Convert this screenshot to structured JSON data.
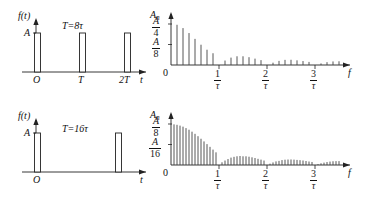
{
  "figure": {
    "stroke_color": "#222222",
    "line_color": "#444444",
    "background": "#ffffff"
  },
  "panels": [
    {
      "id": "time-top",
      "kind": "time-domain",
      "y_axis_label": "f(t)",
      "x_axis_label": "t",
      "amplitude_label": "A",
      "origin_label": "O",
      "period_note": "T=8τ",
      "x_tick_labels": [
        "O",
        "T",
        "2T"
      ],
      "pulse_count": 3
    },
    {
      "id": "spectrum-top",
      "kind": "spectrum",
      "y_axis_label": "A",
      "y_axis_label_sub": "n",
      "x_axis_label": "f",
      "origin_label": "0",
      "y_tick_labels": [
        {
          "num": "A",
          "den": "4"
        },
        {
          "num": "A",
          "den": "8"
        }
      ],
      "x_tick_labels": [
        {
          "num": "1",
          "den": "τ"
        },
        {
          "num": "2",
          "den": "τ"
        },
        {
          "num": "3",
          "den": "τ"
        }
      ]
    },
    {
      "id": "time-bottom",
      "kind": "time-domain",
      "y_axis_label": "f(t)",
      "x_axis_label": "t",
      "amplitude_label": "A",
      "origin_label": "O",
      "period_note": "T=16τ",
      "x_tick_labels": [
        "O"
      ],
      "pulse_count": 2
    },
    {
      "id": "spectrum-bottom",
      "kind": "spectrum",
      "y_axis_label": "A",
      "y_axis_label_sub": "n",
      "x_axis_label": "f",
      "origin_label": "0",
      "y_tick_labels": [
        {
          "num": "A",
          "den": "8"
        },
        {
          "num": "A",
          "den": "16"
        }
      ],
      "x_tick_labels": [
        {
          "num": "1",
          "den": "τ"
        },
        {
          "num": "2",
          "den": "τ"
        },
        {
          "num": "3",
          "den": "τ"
        }
      ]
    }
  ],
  "chart_data": [
    {
      "type": "bar",
      "id": "time-top",
      "title": "T=8τ",
      "xlabel": "t",
      "ylabel": "f(t)",
      "categories": [
        "O",
        "T",
        "2T"
      ],
      "values": [
        1,
        1,
        1
      ],
      "ylim": [
        0,
        1.15
      ],
      "notes": "Rectangular pulse train, pulse width τ, period T = 8τ, amplitude A",
      "grid": false,
      "legend": "none"
    },
    {
      "type": "bar",
      "id": "spectrum-top",
      "title": "Line spectrum for T=8τ",
      "xlabel": "f",
      "ylabel": "A_n",
      "ylim": [
        0,
        0.3125
      ],
      "yticks": [
        0,
        0.125,
        0.25
      ],
      "ytick_labels": [
        "0",
        "A/8",
        "A/4"
      ],
      "xticks": [
        0,
        1,
        2,
        3
      ],
      "xtick_labels": [
        "0",
        "1/τ",
        "2/τ",
        "3/τ"
      ],
      "harmonic_spacing_per_tau": 0.125,
      "x": [
        0.125,
        0.25,
        0.375,
        0.5,
        0.625,
        0.75,
        0.875,
        1.0,
        1.125,
        1.25,
        1.375,
        1.5,
        1.625,
        1.75,
        1.875,
        2.0,
        2.125,
        2.25,
        2.375,
        2.5,
        2.625,
        2.75,
        2.875,
        3.0,
        3.125,
        3.25,
        3.375,
        3.5
      ],
      "values": [
        0.2452,
        0.2251,
        0.1948,
        0.1592,
        0.1236,
        0.0932,
        0.0717,
        0.0,
        0.0272,
        0.045,
        0.0531,
        0.0531,
        0.0476,
        0.0388,
        0.0298,
        0.0,
        0.0141,
        0.025,
        0.0313,
        0.0318,
        0.0284,
        0.024,
        0.0188,
        0.0,
        0.0096,
        0.0173,
        0.0217,
        0.0227
      ],
      "envelope": "A*(tau/T)*|sinc(f*tau)| with tau/T = 1/8",
      "grid": false,
      "legend": "none"
    },
    {
      "type": "bar",
      "id": "time-bottom",
      "title": "T=16τ",
      "xlabel": "t",
      "ylabel": "f(t)",
      "categories": [
        "O",
        "T"
      ],
      "values": [
        1,
        1
      ],
      "ylim": [
        0,
        1.15
      ],
      "notes": "Rectangular pulse train, pulse width τ, period T = 16τ, amplitude A",
      "grid": false,
      "legend": "none"
    },
    {
      "type": "bar",
      "id": "spectrum-bottom",
      "title": "Line spectrum for T=16τ",
      "xlabel": "f",
      "ylabel": "A_n",
      "ylim": [
        0,
        0.156
      ],
      "yticks": [
        0,
        0.0625,
        0.125
      ],
      "ytick_labels": [
        "0",
        "A/16",
        "A/8"
      ],
      "xticks": [
        0,
        1,
        2,
        3
      ],
      "xtick_labels": [
        "0",
        "1/τ",
        "2/τ",
        "3/τ"
      ],
      "harmonic_spacing_per_tau": 0.0625,
      "x": [
        0.0625,
        0.125,
        0.1875,
        0.25,
        0.3125,
        0.375,
        0.4375,
        0.5,
        0.5625,
        0.625,
        0.6875,
        0.75,
        0.8125,
        0.875,
        0.9375,
        1.0,
        1.0625,
        1.125,
        1.1875,
        1.25,
        1.3125,
        1.375,
        1.4375,
        1.5,
        1.5625,
        1.625,
        1.6875,
        1.75,
        1.8125,
        1.875,
        1.9375,
        2.0,
        2.0625,
        2.125,
        2.1875,
        2.25,
        2.3125,
        2.375,
        2.4375,
        2.5,
        2.5625,
        2.625,
        2.6875,
        2.75,
        2.8125,
        2.875,
        2.9375,
        3.0,
        3.0625,
        3.125,
        3.1875,
        3.25,
        3.3125,
        3.375,
        3.4375,
        3.5
      ],
      "values": [
        0.1239,
        0.1225,
        0.1201,
        0.1169,
        0.1125,
        0.1075,
        0.1016,
        0.095,
        0.0878,
        0.08,
        0.0719,
        0.0637,
        0.0553,
        0.0469,
        0.0386,
        0.0,
        0.0082,
        0.0136,
        0.0181,
        0.0225,
        0.0249,
        0.0266,
        0.0274,
        0.0265,
        0.0265,
        0.0252,
        0.0234,
        0.0213,
        0.0188,
        0.0163,
        0.0136,
        0.0,
        0.0041,
        0.0078,
        0.011,
        0.0125,
        0.015,
        0.0162,
        0.0167,
        0.0168,
        0.0163,
        0.0155,
        0.0147,
        0.0137,
        0.0122,
        0.0106,
        0.0092,
        0.0,
        0.0028,
        0.0052,
        0.0073,
        0.0091,
        0.0104,
        0.0114,
        0.0118,
        0.0119
      ],
      "envelope": "A*(tau/T)*|sinc(f*tau)| with tau/T = 1/16",
      "grid": false,
      "legend": "none"
    }
  ]
}
